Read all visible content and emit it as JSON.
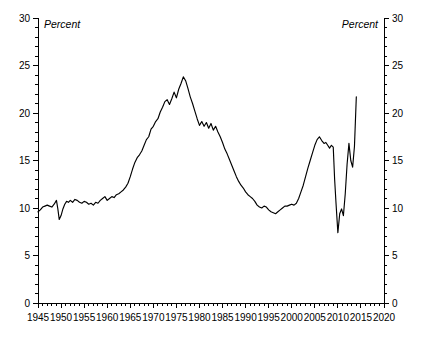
{
  "chart_data": {
    "type": "line",
    "title": "",
    "subtitle": "",
    "xlabel": "",
    "ylabel": "Percent",
    "ylabel_right": "Percent",
    "xlim": [
      1945,
      2020
    ],
    "ylim": [
      0,
      30
    ],
    "grid": false,
    "legend": null,
    "x_ticks": [
      1945,
      1950,
      1955,
      1960,
      1965,
      1970,
      1975,
      1980,
      1985,
      1990,
      1995,
      2000,
      2005,
      2010,
      2015,
      2020
    ],
    "x_tick_labels": [
      "1945",
      "1950",
      "1955",
      "1960",
      "1965",
      "1970",
      "1975",
      "1980",
      "1985",
      "1990",
      "1995",
      "2000",
      "2005",
      "2010",
      "2015",
      "2020"
    ],
    "x_minor_interval": 1,
    "y_ticks": [
      0,
      5,
      10,
      15,
      20,
      25,
      30
    ],
    "y_tick_labels": [
      "0",
      "5",
      "10",
      "15",
      "20",
      "25",
      "30"
    ],
    "y_minor_interval": 1,
    "series": [
      {
        "name": "Percent",
        "color": "#000000",
        "x": [
          1945.0,
          1945.5,
          1946.0,
          1946.5,
          1947.0,
          1947.5,
          1948.0,
          1948.5,
          1949.0,
          1949.3,
          1949.6,
          1950.0,
          1950.4,
          1950.8,
          1951.2,
          1951.6,
          1952.0,
          1952.5,
          1953.0,
          1953.5,
          1954.0,
          1954.5,
          1955.0,
          1955.5,
          1956.0,
          1956.5,
          1957.0,
          1957.5,
          1958.0,
          1958.5,
          1959.0,
          1959.5,
          1960.0,
          1960.5,
          1961.0,
          1961.5,
          1962.0,
          1962.5,
          1963.0,
          1963.5,
          1964.0,
          1964.5,
          1965.0,
          1965.5,
          1966.0,
          1966.5,
          1967.0,
          1967.5,
          1968.0,
          1968.5,
          1969.0,
          1969.5,
          1970.0,
          1970.5,
          1971.0,
          1971.5,
          1972.0,
          1972.5,
          1973.0,
          1973.5,
          1974.0,
          1974.5,
          1975.0,
          1975.5,
          1976.0,
          1976.5,
          1977.0,
          1977.5,
          1978.0,
          1978.5,
          1979.0,
          1979.5,
          1980.0,
          1980.5,
          1981.0,
          1981.5,
          1982.0,
          1982.5,
          1983.0,
          1983.5,
          1984.0,
          1984.5,
          1985.0,
          1985.5,
          1986.0,
          1986.5,
          1987.0,
          1987.5,
          1988.0,
          1988.5,
          1989.0,
          1989.5,
          1990.0,
          1990.5,
          1991.0,
          1991.5,
          1992.0,
          1992.5,
          1993.0,
          1993.5,
          1994.0,
          1994.5,
          1995.0,
          1995.5,
          1996.0,
          1996.5,
          1997.0,
          1997.5,
          1998.0,
          1998.5,
          1999.0,
          1999.5,
          2000.0,
          2000.5,
          2001.0,
          2001.5,
          2002.0,
          2002.5,
          2003.0,
          2003.5,
          2004.0,
          2004.5,
          2005.0,
          2005.5,
          2006.0,
          2006.5,
          2007.0,
          2007.4,
          2007.8,
          2008.2,
          2008.6,
          2009.0,
          2009.3,
          2009.6,
          2010.0,
          2010.4,
          2010.8,
          2011.2,
          2011.6,
          2012.0,
          2012.4,
          2012.8,
          2013.2,
          2013.6,
          2014.0
        ],
        "y": [
          9.6,
          9.8,
          10.1,
          10.2,
          10.3,
          10.2,
          10.1,
          10.4,
          10.8,
          9.9,
          8.8,
          9.2,
          9.9,
          10.4,
          10.7,
          10.6,
          10.8,
          10.6,
          10.9,
          10.8,
          10.6,
          10.5,
          10.7,
          10.6,
          10.4,
          10.5,
          10.3,
          10.6,
          10.5,
          10.8,
          11.0,
          11.2,
          10.8,
          11.0,
          11.2,
          11.1,
          11.4,
          11.5,
          11.7,
          11.9,
          12.2,
          12.6,
          13.3,
          14.1,
          14.8,
          15.3,
          15.6,
          16.0,
          16.6,
          17.2,
          17.5,
          18.3,
          18.6,
          19.1,
          19.4,
          20.1,
          20.6,
          21.2,
          21.4,
          20.9,
          21.5,
          22.2,
          21.6,
          22.5,
          23.1,
          23.8,
          23.4,
          22.6,
          21.7,
          21.0,
          20.2,
          19.4,
          18.7,
          19.1,
          18.6,
          19.0,
          18.4,
          18.9,
          18.2,
          18.6,
          18.0,
          17.5,
          16.9,
          16.2,
          15.7,
          15.1,
          14.5,
          13.9,
          13.3,
          12.8,
          12.4,
          12.1,
          11.7,
          11.4,
          11.2,
          11.0,
          10.7,
          10.3,
          10.1,
          10.0,
          10.2,
          10.1,
          9.8,
          9.6,
          9.5,
          9.4,
          9.6,
          9.8,
          10.0,
          10.2,
          10.2,
          10.3,
          10.4,
          10.3,
          10.5,
          11.0,
          11.7,
          12.4,
          13.3,
          14.2,
          15.0,
          15.8,
          16.6,
          17.2,
          17.5,
          17.1,
          16.8,
          16.9,
          16.6,
          16.3,
          16.6,
          16.4,
          13.0,
          10.5,
          7.4,
          9.4,
          9.9,
          9.2,
          11.5,
          14.6,
          16.8,
          15.0,
          14.3,
          16.5,
          21.7
        ]
      }
    ],
    "annotations": []
  },
  "labels": {
    "unit_left": "Percent",
    "unit_right": "Percent"
  }
}
